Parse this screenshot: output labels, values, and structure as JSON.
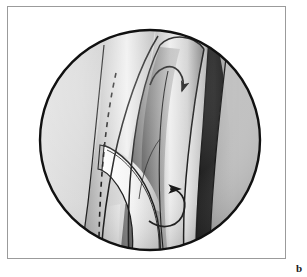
{
  "figure": {
    "panel_label": "b",
    "caption_text": "",
    "frame_color": "#9b9b9b",
    "background_color": "#ffffff",
    "illustration": {
      "kind": "endoscopic-surgical-illustration",
      "style": "grayscale-shaded-line-drawing",
      "viewport_shape": "circle",
      "circle": {
        "cx": 149,
        "cy": 139,
        "r": 110
      },
      "outline_color": "#111111",
      "palette": {
        "dark_band": "#1e1e1e",
        "mid_gray": "#8c8c8c",
        "light_gray": "#d2d2d2",
        "highlight": "#f7f7f7",
        "shadow": "#5a5a5a"
      },
      "annotations": [
        {
          "name": "left-curved-arrow",
          "direction": "left",
          "style": "solid-curved"
        },
        {
          "name": "top-hook-arrow",
          "direction": "down-right",
          "style": "solid-hooked"
        },
        {
          "name": "dashed-incision-line",
          "style": "dashed",
          "orientation": "vertical-curved"
        }
      ],
      "structures": [
        {
          "name": "left-wall",
          "shading": "light-gray-gradient"
        },
        {
          "name": "central-fold",
          "shading": "bright-highlight-gradient"
        },
        {
          "name": "mobilized-flap",
          "shading": "white-highlight"
        },
        {
          "name": "right-dark-recess",
          "shading": "near-black"
        },
        {
          "name": "right-wall",
          "shading": "mid-gray-gradient"
        }
      ]
    }
  }
}
